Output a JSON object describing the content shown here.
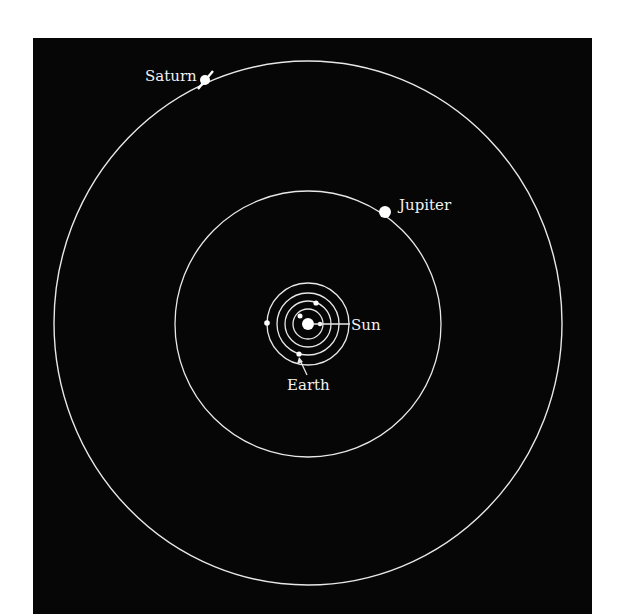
{
  "diagram": {
    "background": "#060606",
    "line_color": "#e8e8e8",
    "labels": {
      "saturn": "Saturn",
      "jupiter": "Jupiter",
      "sun": "Sun",
      "earth": "Earth"
    },
    "bodies": [
      "Sun",
      "Mercury",
      "Venus",
      "Earth",
      "Mars",
      "Jupiter",
      "Saturn"
    ]
  }
}
